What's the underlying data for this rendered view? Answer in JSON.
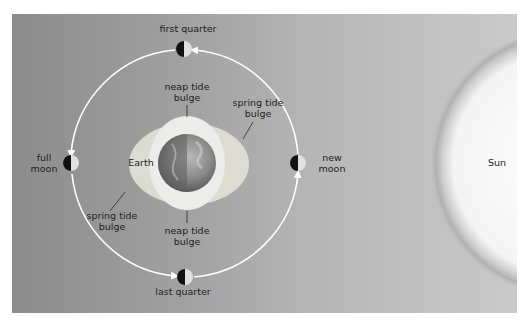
{
  "diagram": {
    "moon_phases": {
      "first_quarter": "first quarter",
      "full_moon_line1": "full",
      "full_moon_line2": "moon",
      "new_moon_line1": "new",
      "new_moon_line2": "moon",
      "last_quarter": "last quarter"
    },
    "earth_label": "Earth",
    "sun_label": "Sun",
    "bulges": {
      "neap_top_line1": "neap tide",
      "neap_top_line2": "bulge",
      "spring_right_line1": "spring tide",
      "spring_right_line2": "bulge",
      "spring_left_line1": "spring tide",
      "spring_left_line2": "bulge",
      "neap_bottom_line1": "neap tide",
      "neap_bottom_line2": "bulge"
    },
    "colors": {
      "background_left": "#8c8c8c",
      "background_right": "#cacaca",
      "orbit": "#ffffff",
      "spring_bulge": "#dcdcd2",
      "neap_bulge": "#ececea",
      "sun": "#ffffff"
    }
  }
}
